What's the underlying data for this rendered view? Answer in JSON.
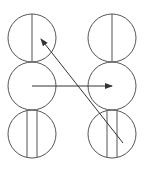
{
  "diagram": {
    "stroke": "#555555",
    "arrow_color": "#333333",
    "circles": [
      {
        "id": "top-left",
        "cx": 32,
        "cy": 38,
        "r": 24,
        "lines": [
          32
        ]
      },
      {
        "id": "top-right",
        "cx": 112,
        "cy": 38,
        "r": 24,
        "lines": [
          112
        ]
      },
      {
        "id": "middle-left",
        "cx": 32,
        "cy": 86,
        "r": 24,
        "lines": []
      },
      {
        "id": "middle-right",
        "cx": 112,
        "cy": 86,
        "r": 24,
        "lines": []
      },
      {
        "id": "bottom-left",
        "cx": 32,
        "cy": 134,
        "r": 24,
        "lines": [
          27,
          37
        ]
      },
      {
        "id": "bottom-right",
        "cx": 112,
        "cy": 134,
        "r": 24,
        "lines": [
          107,
          117
        ]
      }
    ],
    "arrows": [
      {
        "id": "horizontal-arrow",
        "x1": 32,
        "y1": 86,
        "x2": 112,
        "y2": 86
      },
      {
        "id": "diagonal-arrow",
        "x1": 123,
        "y1": 143,
        "x2": 41,
        "y2": 39
      }
    ]
  }
}
